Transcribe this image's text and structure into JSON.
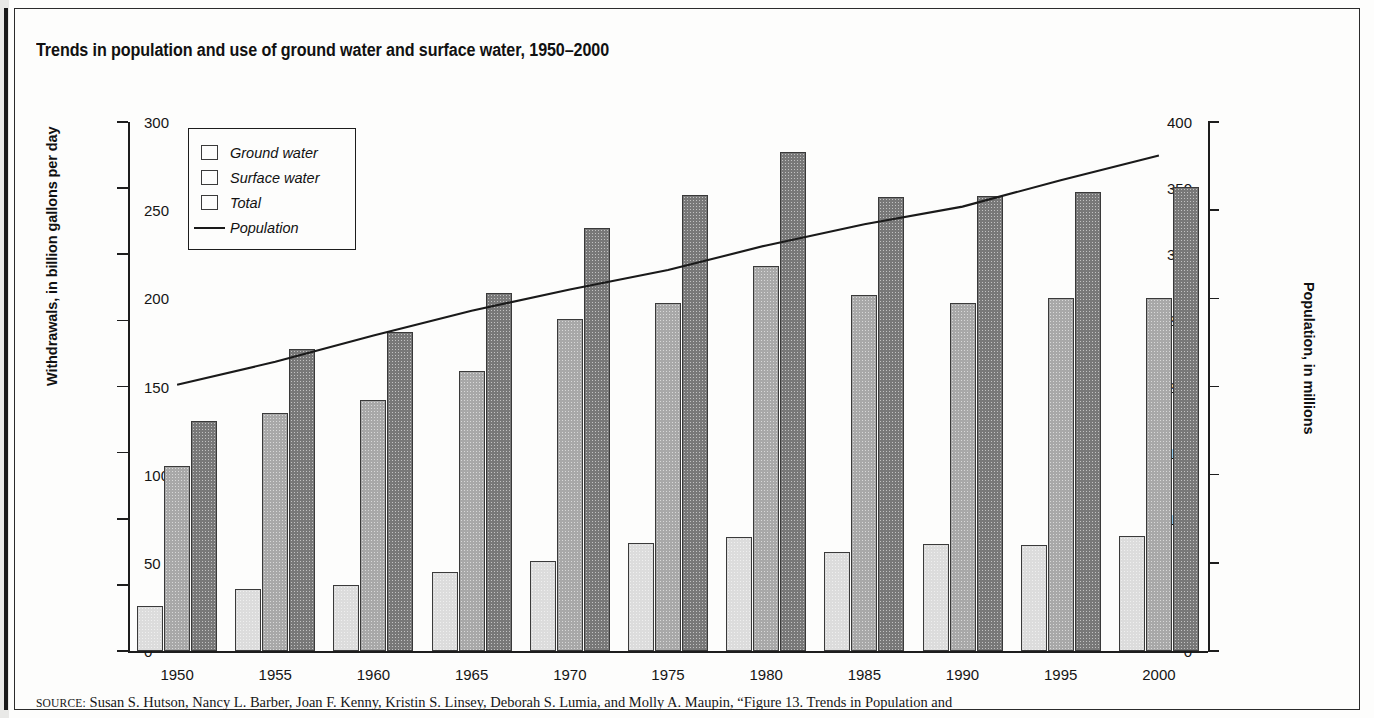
{
  "figure": {
    "title": "Trends in population and use of ground water and surface water, 1950–2000",
    "source_prefix": "SOURCE:",
    "source_text": "Susan S. Hutson, Nancy L. Barber, Joan F. Kenny, Kristin S. Linsey, Deborah S. Lumia, and Molly A. Maupin, “Figure 13. Trends in Population and"
  },
  "chart_data": {
    "type": "bar",
    "title": "Trends in population and use of ground water and surface water, 1950–2000",
    "xlabel": "",
    "ylabel": "Withdrawals, in billion gallons per day",
    "y2label": "Population, in millions",
    "categories": [
      "1950",
      "1955",
      "1960",
      "1965",
      "1970",
      "1975",
      "1980",
      "1985",
      "1990",
      "1995",
      "2000"
    ],
    "ylim": [
      0,
      400
    ],
    "y2lim": [
      0,
      300
    ],
    "yticks": [
      0,
      50,
      100,
      150,
      200,
      250,
      300,
      350,
      400
    ],
    "y2ticks": [
      0,
      50,
      100,
      150,
      200,
      250,
      300
    ],
    "grid": false,
    "legend_position": "upper-left",
    "series": [
      {
        "name": "Ground water",
        "type": "bar",
        "axis": "left",
        "color": "#dcdcdc",
        "values": [
          34,
          47,
          50,
          60,
          68,
          82,
          86,
          75,
          81,
          80,
          87
        ]
      },
      {
        "name": "Surface water",
        "type": "bar",
        "axis": "left",
        "color": "#a8a8a8",
        "values": [
          140,
          180,
          190,
          212,
          251,
          263,
          291,
          269,
          263,
          267,
          267
        ]
      },
      {
        "name": "Total",
        "type": "bar",
        "axis": "left",
        "color": "#787878",
        "values": [
          174,
          228,
          241,
          271,
          320,
          345,
          377,
          343,
          344,
          347,
          351
        ]
      },
      {
        "name": "Population",
        "type": "line",
        "axis": "right",
        "color": "#1a1a1a",
        "values": [
          151,
          164,
          179,
          193,
          205,
          216,
          230,
          242,
          252,
          267,
          281
        ]
      }
    ]
  },
  "legend": {
    "items": [
      {
        "label": "Ground water",
        "marker": "swatch",
        "color": "#dcdcdc"
      },
      {
        "label": "Surface water",
        "marker": "swatch",
        "color": "#a8a8a8"
      },
      {
        "label": "Total",
        "marker": "swatch",
        "color": "#787878"
      },
      {
        "label": "Population",
        "marker": "line",
        "color": "#1a1a1a"
      }
    ]
  }
}
